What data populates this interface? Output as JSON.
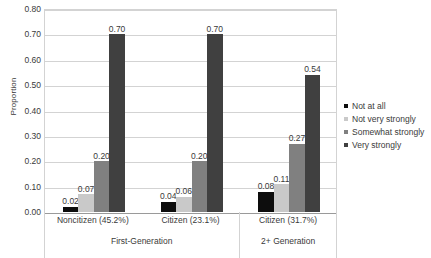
{
  "chart_data": {
    "type": "bar",
    "title": "",
    "xlabel": "",
    "ylabel": "Proportion",
    "ylim": [
      0.0,
      0.8
    ],
    "ytick_step": 0.1,
    "ytick_labels": [
      "0.80",
      "0.70",
      "0.60",
      "0.50",
      "0.40",
      "0.30",
      "0.20",
      "0.10",
      "0.00"
    ],
    "ytick_values": [
      0.8,
      0.7,
      0.6,
      0.5,
      0.4,
      0.3,
      0.2,
      0.1,
      0.0
    ],
    "grid": true,
    "legend_position": "right",
    "categories": [
      "Noncitizen (45.2%)",
      "Citizen (23.1%)",
      "Citizen (31.7%)"
    ],
    "supercategories": [
      {
        "label": "First-Generation",
        "categories": [
          "Noncitizen (45.2%)",
          "Citizen (23.1%)"
        ]
      },
      {
        "label": "2+ Generation",
        "categories": [
          "Citizen (31.7%)"
        ]
      }
    ],
    "series": [
      {
        "name": "Not at all",
        "color": "#0d0d0d",
        "values": [
          0.02,
          0.04,
          0.08
        ],
        "labels": [
          "0.02",
          "0.04",
          "0.08"
        ]
      },
      {
        "name": "Not very strongly",
        "color": "#c9c9c9",
        "values": [
          0.07,
          0.06,
          0.11
        ],
        "labels": [
          "0.07",
          "0.06",
          "0.11"
        ]
      },
      {
        "name": "Somewhat strongly",
        "color": "#808080",
        "values": [
          0.2,
          0.2,
          0.27
        ],
        "labels": [
          "0.20",
          "0.20",
          "0.27"
        ]
      },
      {
        "name": "Very strongly",
        "color": "#404040",
        "values": [
          0.7,
          0.7,
          0.54
        ],
        "labels": [
          "0.70",
          "0.70",
          "0.54"
        ]
      }
    ]
  },
  "legend": {
    "items": [
      {
        "label": "Not at all",
        "color": "#0d0d0d"
      },
      {
        "label": "Not very strongly",
        "color": "#c9c9c9"
      },
      {
        "label": "Somewhat strongly",
        "color": "#808080"
      },
      {
        "label": "Very strongly",
        "color": "#404040"
      }
    ]
  },
  "colors": {
    "grid": "#d3d3d3",
    "baseline": "#9a9a9a",
    "text": "#3a3a3a",
    "background": "#ffffff"
  }
}
